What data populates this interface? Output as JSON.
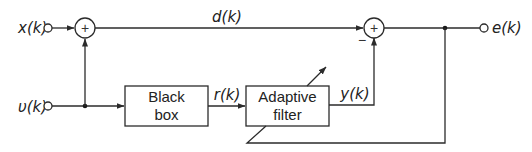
{
  "diagram": {
    "type": "block-diagram",
    "signals": {
      "input_x": "x(k)",
      "input_v": "υ(k)",
      "desired": "d(k)",
      "reference": "r(k)",
      "filter_output": "y(k)",
      "error": "e(k)"
    },
    "blocks": {
      "black_box": {
        "line1": "Black",
        "line2": "box"
      },
      "adaptive_filter": {
        "line1": "Adaptive",
        "line2": "filter"
      }
    },
    "summers": {
      "summer1": {
        "symbol": "+"
      },
      "summer2": {
        "symbol": "+",
        "minus_sign": "−"
      }
    },
    "colors": {
      "line": "#2b2b2b",
      "text": "#222222",
      "background": "#ffffff"
    }
  }
}
